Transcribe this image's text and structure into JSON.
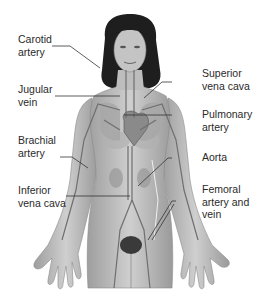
{
  "diagram": {
    "colors": {
      "background": "#ffffff",
      "skin": "#b5b5b5",
      "skin_light": "#d2d2d2",
      "hair": "#1e1e1e",
      "vessel": "#6f6f6f",
      "heart": "#8a8a8a",
      "leader_line": "#333333",
      "text": "#2a2a2a"
    },
    "labels_left": [
      {
        "id": "carotid",
        "text": "Carotid\nartery"
      },
      {
        "id": "jugular",
        "text": "Jugular\nvein"
      },
      {
        "id": "brachial",
        "text": "Brachial\nartery"
      },
      {
        "id": "inferior-vena-cava",
        "text": "Inferior\nvena cava"
      }
    ],
    "labels_right": [
      {
        "id": "superior-vena-cava",
        "text": "Superior\nvena cava"
      },
      {
        "id": "pulmonary",
        "text": "Pulmonary\nartery"
      },
      {
        "id": "aorta",
        "text": "Aorta"
      },
      {
        "id": "femoral",
        "text": "Femoral\nartery and\nvein"
      }
    ]
  }
}
